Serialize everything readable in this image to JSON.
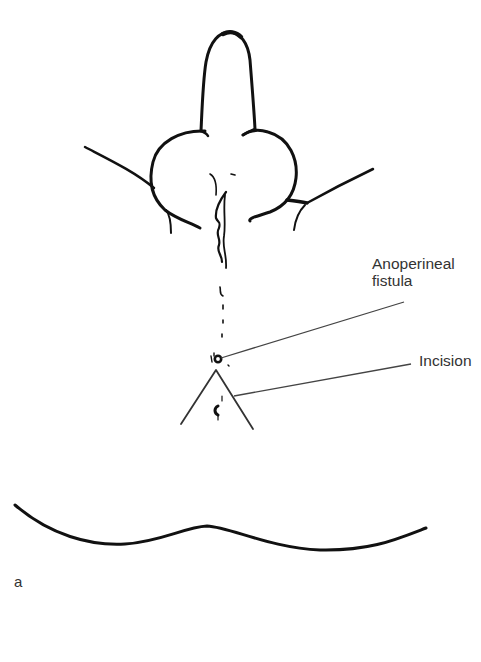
{
  "figure": {
    "panel_label": "a",
    "labels": {
      "fistula_line1": "Anoperineal",
      "fistula_line2": "fistula",
      "incision": "Incision"
    },
    "colors": {
      "line": "#111111",
      "label_text": "#333333",
      "leader": "#444444",
      "background": "#ffffff"
    }
  }
}
